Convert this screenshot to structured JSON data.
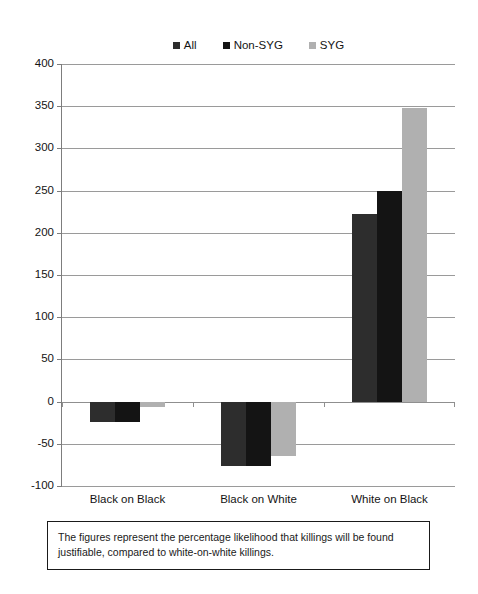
{
  "chart_data": {
    "type": "bar",
    "title": "",
    "subtitle": "",
    "xlabel": "",
    "ylabel": "",
    "categories": [
      "Black on Black",
      "Black on White",
      "White on Black"
    ],
    "series": [
      {
        "name": "All",
        "color": "#2d2d2d",
        "values": [
          -24,
          -76,
          222
        ]
      },
      {
        "name": "Non-SYG",
        "color": "#141414",
        "values": [
          -24,
          -76,
          249
        ]
      },
      {
        "name": "SYG",
        "color": "#b0b0b0",
        "values": [
          -6,
          -65,
          348
        ]
      }
    ],
    "ylim": [
      -100,
      400
    ],
    "ytick_step": 50,
    "yticks": [
      400,
      350,
      300,
      250,
      200,
      150,
      100,
      50,
      0,
      -50,
      -100
    ],
    "ytick_labels": [
      "400",
      "350",
      "300",
      "250",
      "200",
      "150",
      "100",
      "50",
      "0",
      "-50",
      "-100"
    ],
    "grid": true,
    "grid_axis": "y",
    "legend_position": "top-center",
    "zero_line": 0,
    "annotations": [
      "The figures represent the percentage likelihood that killings will be found justifiable, compared to white-on-white killings."
    ]
  },
  "legend": {
    "entries": [
      {
        "label": "All",
        "swatch_color": "#2d2d2d",
        "icon": "legend-swatch-icon"
      },
      {
        "label": "Non-SYG",
        "swatch_color": "#141414",
        "icon": "legend-swatch-icon"
      },
      {
        "label": "SYG",
        "swatch_color": "#b0b0b0",
        "icon": "legend-swatch-icon"
      }
    ]
  },
  "caption": {
    "text": "The figures represent the percentage likelihood that killings will be found justifiable, compared to white-on-white killings."
  }
}
